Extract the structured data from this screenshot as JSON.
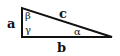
{
  "diagram": {
    "type": "right-triangle",
    "sides": {
      "a": "a",
      "b": "b",
      "c": "c"
    },
    "angles": {
      "alpha": "α",
      "beta": "β",
      "gamma": "γ"
    },
    "colors": {
      "stroke": "#111111",
      "background": "#ffffff"
    }
  }
}
